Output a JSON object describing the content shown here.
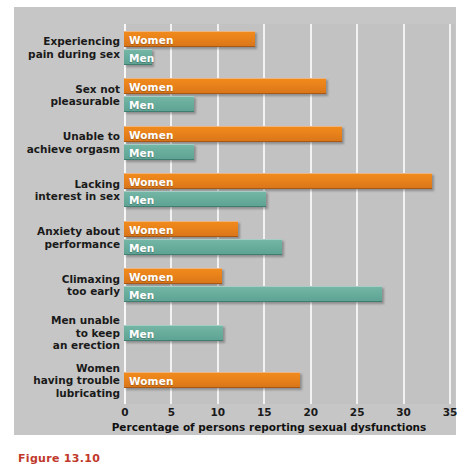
{
  "chart_data": {
    "type": "bar",
    "orientation": "horizontal",
    "title": "",
    "xlabel": "Percentage of persons reporting sexual dysfunctions",
    "ylabel": "",
    "xlim": [
      0,
      35
    ],
    "xticks": [
      0,
      5,
      10,
      15,
      20,
      25,
      30,
      35
    ],
    "grid": true,
    "legend": "inline-bar-labels",
    "categories": [
      "Experiencing\npain during sex",
      "Sex not\npleasurable",
      "Unable to\nachieve orgasm",
      "Lacking\ninterest in sex",
      "Anxiety about\nperformance",
      "Climaxing\ntoo early",
      "Men unable\nto keep\nan erection",
      "Women\nhaving trouble\nlubricating"
    ],
    "series": [
      {
        "name": "Women",
        "color": "#e9821a",
        "values": [
          14.1,
          21.8,
          23.5,
          33.2,
          12.3,
          10.6,
          null,
          19.0
        ]
      },
      {
        "name": "Men",
        "color": "#69ad9d",
        "values": [
          3.0,
          7.5,
          7.5,
          15.3,
          17.0,
          27.8,
          10.7,
          null
        ]
      }
    ],
    "bar_labels": {
      "women": "Women",
      "men": "Men"
    },
    "background_color": "#c6c6c6",
    "plot_background_color": "#c2c2c2",
    "gridline_color": "#f2f2f2"
  },
  "caption": {
    "text": "Figure 13.10"
  }
}
